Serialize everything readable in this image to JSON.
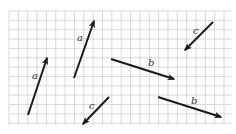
{
  "diagram": {
    "type": "vector-grid",
    "grid": {
      "x0": 9,
      "y0": 11,
      "x1": 231,
      "y1": 125,
      "step": 9.35,
      "color": "#cfcfcf",
      "bg": "#ffffff"
    },
    "arrow_color": "#1a1a1a",
    "vectors": [
      {
        "id": "a1",
        "label": "a",
        "tail": [
          28,
          115
        ],
        "head": [
          47,
          58
        ],
        "label_pos": [
          32,
          79
        ]
      },
      {
        "id": "a2",
        "label": "a",
        "tail": [
          74,
          78
        ],
        "head": [
          94,
          21
        ],
        "label_pos": [
          77,
          41
        ]
      },
      {
        "id": "b1",
        "label": "b",
        "tail": [
          111,
          59
        ],
        "head": [
          174,
          79
        ],
        "label_pos": [
          148,
          66
        ]
      },
      {
        "id": "c1",
        "label": "c",
        "tail": [
          213,
          22
        ],
        "head": [
          185,
          50
        ],
        "label_pos": [
          193,
          34
        ]
      },
      {
        "id": "c2",
        "label": "c",
        "tail": [
          109,
          97
        ],
        "head": [
          83,
          124
        ],
        "label_pos": [
          89,
          109
        ]
      },
      {
        "id": "b2",
        "label": "b",
        "tail": [
          158,
          97
        ],
        "head": [
          221,
          117
        ],
        "label_pos": [
          191,
          104
        ]
      }
    ]
  }
}
